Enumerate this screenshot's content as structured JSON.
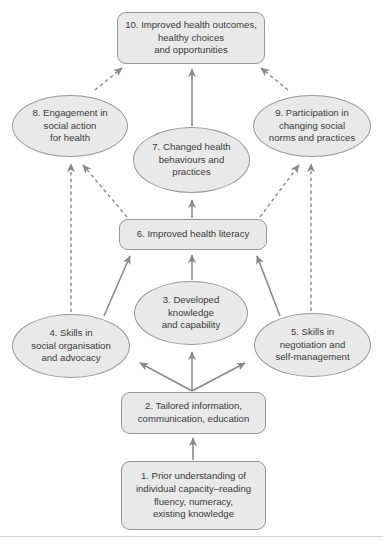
{
  "colors": {
    "node_fill": "#e9e9e9",
    "node_border": "#979797",
    "arrow": "#8a8a8a",
    "text": "#3b3b3b",
    "bottom_rule": "#cfd5d9",
    "background": "#ffffff"
  },
  "diagram": {
    "type": "flow-diagram",
    "nodes": [
      {
        "id": "1",
        "shape": "rect",
        "label": "1. Prior understanding of\nindividual capacity–reading\nfluency, numeracy,\nexisting knowledge"
      },
      {
        "id": "2",
        "shape": "rect",
        "label": "2. Tailored information,\ncommunication, education"
      },
      {
        "id": "3",
        "shape": "ellipse",
        "label": "3. Developed\nknowledge\nand capability"
      },
      {
        "id": "4",
        "shape": "ellipse",
        "label": "4. Skills in\nsocial organisation\nand advocacy"
      },
      {
        "id": "5",
        "shape": "ellipse",
        "label": "5. Skills in\nnegotiation and\nself-management"
      },
      {
        "id": "6",
        "shape": "rect",
        "label": "6. Improved health literacy"
      },
      {
        "id": "7",
        "shape": "ellipse",
        "label": "7. Changed health\nbehaviours and\npractices"
      },
      {
        "id": "8",
        "shape": "ellipse",
        "label": "8. Engagement in\nsocial action\nfor health"
      },
      {
        "id": "9",
        "shape": "ellipse",
        "label": "9. Participation in\nchanging social\nnorms and practices"
      },
      {
        "id": "10",
        "shape": "rect",
        "label": "10. Improved health outcomes,\nhealthy choices\nand opportunities"
      }
    ],
    "edges": [
      {
        "from": "1",
        "to": "2",
        "style": "solid"
      },
      {
        "from": "2",
        "to": "3",
        "style": "solid"
      },
      {
        "from": "2",
        "to": "4",
        "style": "solid"
      },
      {
        "from": "2",
        "to": "5",
        "style": "solid"
      },
      {
        "from": "3",
        "to": "6",
        "style": "solid"
      },
      {
        "from": "4",
        "to": "6",
        "style": "solid"
      },
      {
        "from": "5",
        "to": "6",
        "style": "solid"
      },
      {
        "from": "6",
        "to": "7",
        "style": "solid"
      },
      {
        "from": "7",
        "to": "10",
        "style": "solid"
      },
      {
        "from": "4",
        "to": "8",
        "style": "dashed"
      },
      {
        "from": "5",
        "to": "9",
        "style": "dashed"
      },
      {
        "from": "6",
        "to": "8",
        "style": "dashed"
      },
      {
        "from": "6",
        "to": "9",
        "style": "dashed"
      },
      {
        "from": "8",
        "to": "10",
        "style": "dashed"
      },
      {
        "from": "9",
        "to": "10",
        "style": "dashed"
      }
    ]
  }
}
